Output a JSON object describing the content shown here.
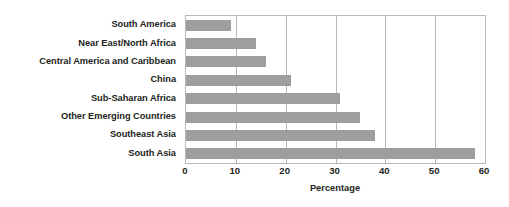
{
  "chart_data": {
    "type": "bar",
    "orientation": "horizontal",
    "title": "",
    "subtitle": "",
    "xlabel": "Percentage",
    "ylabel": "",
    "categories": [
      "South America",
      "Near East/North Africa",
      "Central America and Caribbean",
      "China",
      "Sub-Saharan Africa",
      "Other Emerging Countries",
      "Southeast Asia",
      "South Asia"
    ],
    "values": [
      9,
      14,
      16,
      21,
      31,
      35,
      38,
      58
    ],
    "xlim": [
      0,
      60
    ],
    "xticks": [
      0,
      10,
      20,
      30,
      40,
      50,
      60
    ],
    "xtick_labels": [
      "0",
      "10",
      "20",
      "30",
      "40",
      "50",
      "60"
    ],
    "grid": "vertical",
    "legend": "none",
    "bar_color": "#9e9e9e",
    "grid_color": "#b8b8b8",
    "text_color": "#231f20",
    "background_color": "#ffffff"
  }
}
